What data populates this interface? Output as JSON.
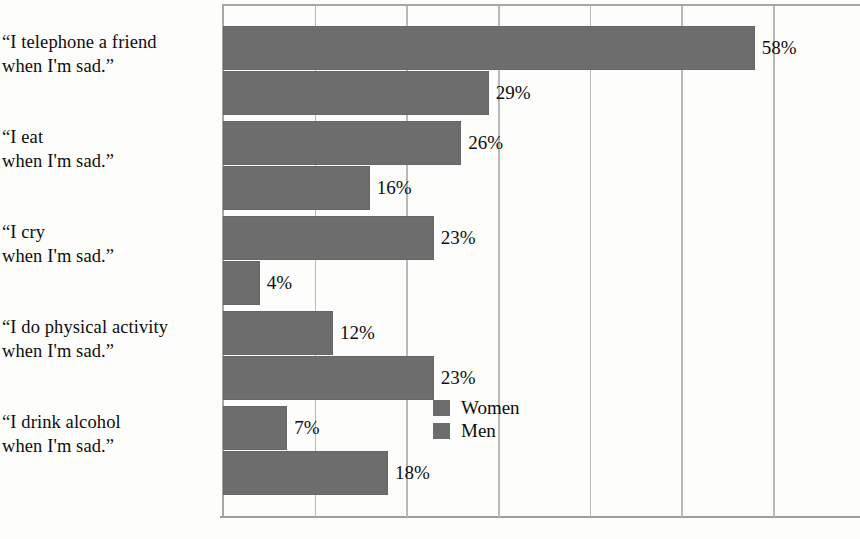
{
  "chart_data": {
    "type": "bar",
    "orientation": "horizontal",
    "title": "",
    "subtitle": "",
    "xlabel": "",
    "ylabel": "",
    "xlim": [
      0,
      60
    ],
    "xticks": [
      0,
      10,
      20,
      30,
      40,
      50,
      60
    ],
    "grid": true,
    "grid_axis": "x",
    "tick_labels_visible": false,
    "legend_position": "inside-right-middle",
    "bar_color": "#6d6d6d",
    "gridline_color": "#b9b9b9",
    "frame_color": "#a8a8a8",
    "text_color": "#0d0d0d",
    "background": "#fdfdfc",
    "categories": [
      "“I telephone a friend\nwhen I'm sad.”",
      "“I eat\nwhen I'm sad.”",
      "“I cry\nwhen I'm sad.”",
      "“I do physical activity\nwhen I'm sad.”",
      "“I drink alcohol\nwhen I'm sad.”"
    ],
    "series": [
      {
        "name": "Women",
        "color": "#6d6d6d",
        "values": [
          58,
          26,
          23,
          12,
          7
        ],
        "labels": [
          "58%",
          "26%",
          "23%",
          "12%",
          "7%"
        ]
      },
      {
        "name": "Men",
        "color": "#6d6d6d",
        "values": [
          29,
          16,
          4,
          23,
          18
        ],
        "labels": [
          "29%",
          "16%",
          "4%",
          "23%",
          "18%"
        ]
      }
    ]
  },
  "legend": {
    "items": [
      {
        "label": "Women",
        "color": "#6d6d6d"
      },
      {
        "label": "Men",
        "color": "#6d6d6d"
      }
    ]
  }
}
